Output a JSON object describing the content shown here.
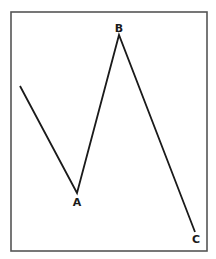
{
  "diagram": {
    "type": "zigzag-wave",
    "frame": {
      "x": 11,
      "y": 12,
      "width": 196,
      "height": 239,
      "stroke": "#555555"
    },
    "line_color": "#1a1a1a",
    "start_point": {
      "x": 20,
      "y": 86
    },
    "points": [
      {
        "label": "A",
        "x": 77,
        "y": 193,
        "label_x": 77,
        "label_y": 206
      },
      {
        "label": "B",
        "x": 119,
        "y": 35,
        "label_x": 119,
        "label_y": 32
      },
      {
        "label": "C",
        "x": 195,
        "y": 232,
        "label_x": 196,
        "label_y": 243
      }
    ]
  }
}
